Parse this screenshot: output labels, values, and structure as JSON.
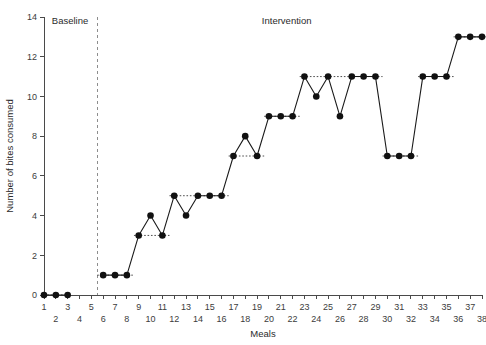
{
  "chart_data": {
    "type": "line",
    "title": "",
    "xlabel": "Meals",
    "ylabel": "Number of bites consumed",
    "xlim": [
      1,
      38
    ],
    "ylim": [
      0,
      14
    ],
    "ytick_step": 2,
    "yticks": [
      0,
      2,
      4,
      6,
      8,
      10,
      12,
      14
    ],
    "ytick_labels": [
      "0",
      "2",
      "4",
      "6",
      "8",
      "10",
      "12",
      "14"
    ],
    "xticks": [
      1,
      2,
      3,
      4,
      5,
      6,
      7,
      8,
      9,
      10,
      11,
      12,
      13,
      14,
      15,
      16,
      17,
      18,
      19,
      20,
      21,
      22,
      23,
      24,
      25,
      26,
      27,
      28,
      29,
      30,
      31,
      32,
      33,
      34,
      35,
      36,
      37,
      38
    ],
    "xtick_labels_top_row": [
      "1",
      "3",
      "5",
      "7",
      "9",
      "11",
      "13",
      "15",
      "17",
      "19",
      "21",
      "23",
      "25",
      "27",
      "29",
      "31",
      "33",
      "35",
      "37"
    ],
    "xtick_labels_bottom_row": [
      "2",
      "4",
      "6",
      "8",
      "10",
      "12",
      "14",
      "16",
      "18",
      "20",
      "22",
      "24",
      "26",
      "28",
      "30",
      "32",
      "34",
      "36",
      "38"
    ],
    "grid": false,
    "legend": "none",
    "phase_line_x": 5.5,
    "phases": [
      {
        "name": "Baseline",
        "label": "Baseline",
        "x_center": 3.2
      },
      {
        "name": "Intervention",
        "label": "Intervention",
        "x_center": 21.5
      }
    ],
    "series": [
      {
        "name": "bites-consumed",
        "x": [
          1,
          2,
          3,
          6,
          7,
          8,
          9,
          10,
          11,
          12,
          13,
          14,
          15,
          16,
          17,
          18,
          19,
          20,
          21,
          22,
          23,
          24,
          25,
          26,
          27,
          28,
          29,
          30,
          31,
          32,
          33,
          34,
          35,
          36,
          37,
          38
        ],
        "values": [
          0,
          0,
          0,
          1,
          1,
          1,
          3,
          4,
          3,
          5,
          4,
          5,
          5,
          5,
          7,
          8,
          7,
          9,
          9,
          9,
          11,
          10,
          11,
          9,
          11,
          11,
          11,
          7,
          7,
          7,
          11,
          11,
          11,
          13,
          13,
          13
        ],
        "breaks_after_x": [
          3
        ]
      }
    ],
    "level_lines": [
      {
        "y": 0,
        "x_start": 1,
        "x_end": 3
      },
      {
        "y": 1,
        "x_start": 5.5,
        "x_end": 8.6
      },
      {
        "y": 3,
        "x_start": 8.6,
        "x_end": 11.6
      },
      {
        "y": 5,
        "x_start": 11.6,
        "x_end": 16.6
      },
      {
        "y": 7,
        "x_start": 16.6,
        "x_end": 19.6
      },
      {
        "y": 9,
        "x_start": 19.6,
        "x_end": 22.6
      },
      {
        "y": 11,
        "x_start": 22.6,
        "x_end": 29.6
      },
      {
        "y": 7,
        "x_start": 29.6,
        "x_end": 32.6
      },
      {
        "y": 11,
        "x_start": 32.6,
        "x_end": 35.6
      },
      {
        "y": 13,
        "x_start": 35.6,
        "x_end": 38.4
      }
    ]
  },
  "colors": {
    "marker": "#111111",
    "line": "#1a1a1a",
    "axis": "#4a4a4a",
    "phase_line": "#8d8d8d",
    "level_line": "#3a3a3a",
    "background": "#ffffff"
  }
}
